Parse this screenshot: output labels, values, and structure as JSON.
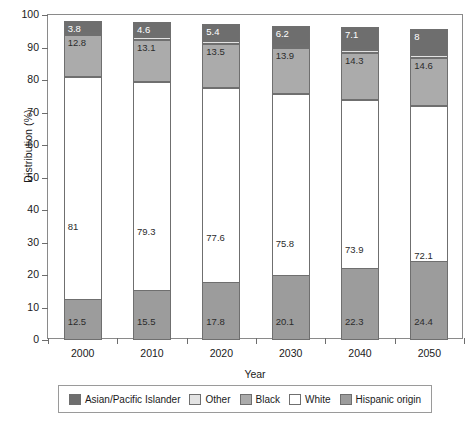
{
  "chart_data": {
    "type": "bar",
    "subtype": "stacked-bar",
    "title": "",
    "xlabel": "Year",
    "ylabel": "Distribution (%)",
    "ylim": [
      0,
      100
    ],
    "ytick_step": 10,
    "yticks": [
      "100",
      "90",
      "80",
      "70",
      "60",
      "50",
      "40",
      "30",
      "20",
      "10",
      "0"
    ],
    "categories": [
      "2000",
      "2010",
      "2020",
      "2030",
      "2040",
      "2050"
    ],
    "grid": false,
    "legend_position": "bottom",
    "stack_order_bottom_to_top": [
      "Hispanic origin",
      "White",
      "Black",
      "Other",
      "Asian/Pacific Islander"
    ],
    "series": [
      {
        "name": "Asian/Pacific Islander",
        "color": "#6e6e6e",
        "values": [
          3.8,
          4.6,
          5.4,
          6.2,
          7.1,
          8
        ],
        "labels": [
          "3.8",
          "4.6",
          "5.4",
          "6.2",
          "7.1",
          "8"
        ]
      },
      {
        "name": "Other",
        "color": "#e3e3e3",
        "values": [
          0.7,
          0.8,
          0.8,
          0.8,
          0.9,
          0.9
        ],
        "labels": [
          "0.7",
          "0.8",
          "0.8",
          "0.8",
          "0.9",
          "0.9"
        ]
      },
      {
        "name": "Black",
        "color": "#ababab",
        "values": [
          12.8,
          13.1,
          13.5,
          13.9,
          14.3,
          14.6
        ],
        "labels": [
          "12.8",
          "13.1",
          "13.5",
          "13.9",
          "14.3",
          "14.6"
        ]
      },
      {
        "name": "White",
        "color": "#ffffff",
        "values": [
          81,
          79.3,
          77.6,
          75.8,
          73.9,
          72.1
        ],
        "labels": [
          "81",
          "79.3",
          "77.6",
          "75.8",
          "73.9",
          "72.1"
        ]
      },
      {
        "name": "Hispanic origin",
        "color": "#9c9c9c",
        "values": [
          12.5,
          15.5,
          17.8,
          20.1,
          22.3,
          24.4
        ],
        "labels": [
          "12.5",
          "15.5",
          "17.8",
          "20.1",
          "22.3",
          "24.4"
        ]
      }
    ]
  },
  "axes": {
    "y_title": "Distribution (%)",
    "x_title": "Year"
  },
  "legend": {
    "entries": [
      {
        "label": "Asian/Pacific Islander",
        "color": "#6e6e6e"
      },
      {
        "label": "Other",
        "color": "#e3e3e3"
      },
      {
        "label": "Black",
        "color": "#ababab"
      },
      {
        "label": "White",
        "color": "#ffffff"
      },
      {
        "label": "Hispanic origin",
        "color": "#9c9c9c"
      }
    ]
  }
}
